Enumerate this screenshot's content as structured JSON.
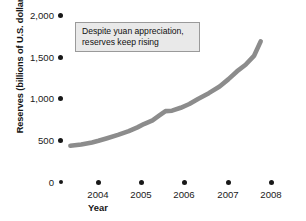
{
  "chart_data": {
    "type": "line",
    "title": "",
    "xlabel": "Year",
    "ylabel": "Reserves (billions of U.S. dollars)",
    "xlim": [
      2003.3,
      2008.0
    ],
    "ylim": [
      0,
      2000
    ],
    "grid": false,
    "legend": null,
    "line_color": "#8c8c8c",
    "annotations": [
      {
        "id": "callout",
        "lines": [
          "Despite yuan appreciation,",
          "reserves keep rising"
        ]
      }
    ],
    "x_tick_labels": [
      "2004",
      "2005",
      "2006",
      "2007",
      "2008"
    ],
    "x_tick_values": [
      2004,
      2005,
      2006,
      2007,
      2008
    ],
    "y_tick_labels": [
      "2,000",
      "1,500",
      "1,000",
      "500",
      "0"
    ],
    "y_tick_values": [
      2000,
      1500,
      1000,
      500,
      0
    ],
    "series": [
      {
        "name": "China foreign exchange reserves",
        "x": [
          2003.35,
          2003.6,
          2003.85,
          2004.0,
          2004.2,
          2004.45,
          2004.7,
          2004.9,
          2005.05,
          2005.25,
          2005.4,
          2005.55,
          2005.7,
          2005.9,
          2006.1,
          2006.3,
          2006.55,
          2006.8,
          2007.0,
          2007.2,
          2007.4,
          2007.6,
          2007.75
        ],
        "y": [
          440,
          455,
          480,
          500,
          530,
          570,
          615,
          660,
          700,
          745,
          800,
          855,
          860,
          895,
          940,
          1000,
          1070,
          1150,
          1235,
          1330,
          1410,
          1520,
          1690
        ]
      }
    ]
  },
  "axis": {
    "y_title": "Reserves (billions of U.S. dollars)",
    "x_title": "Year"
  },
  "annotation": {
    "line1": "Despite yuan appreciation,",
    "line2": "reserves keep rising"
  },
  "y_ticks": [
    {
      "label": "2,000"
    },
    {
      "label": "1,500"
    },
    {
      "label": "1,000"
    },
    {
      "label": "500"
    },
    {
      "label": "0"
    }
  ],
  "x_ticks": [
    {
      "label": "2004"
    },
    {
      "label": "2005"
    },
    {
      "label": "2006"
    },
    {
      "label": "2007"
    },
    {
      "label": "2008"
    }
  ]
}
